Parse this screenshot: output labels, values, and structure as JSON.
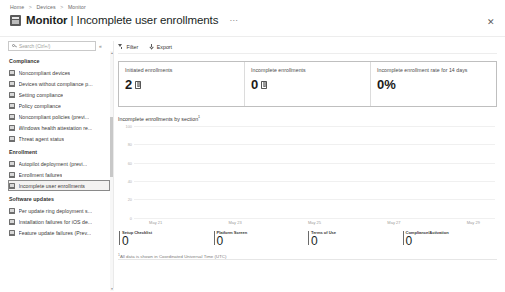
{
  "breadcrumb": {
    "items": [
      "Home",
      "Devices",
      "Monitor"
    ],
    "separator": ">"
  },
  "header": {
    "title_main": "Monitor",
    "title_separator": "|",
    "title_sub": "Incomplete user enrollments",
    "ellipsis": "…",
    "close_label": "✕",
    "icon": "monitor-icon"
  },
  "sidebar": {
    "search": {
      "placeholder": "Search (Ctrl+/)",
      "value": "",
      "icon": "search-icon"
    },
    "collapse_label": "«",
    "groups": [
      {
        "title": "Compliance",
        "items": [
          {
            "label": "Noncompliant devices",
            "selected": false
          },
          {
            "label": "Devices without compliance p...",
            "selected": false
          },
          {
            "label": "Setting compliance",
            "selected": false
          },
          {
            "label": "Policy compliance",
            "selected": false
          },
          {
            "label": "Noncompliant policies (previ...",
            "selected": false
          },
          {
            "label": "Windows health attestation re...",
            "selected": false
          },
          {
            "label": "Threat agent status",
            "selected": false
          }
        ]
      },
      {
        "title": "Enrollment",
        "items": [
          {
            "label": "Autopilot deployment (previ...",
            "selected": false
          },
          {
            "label": "Enrollment failures",
            "selected": false
          },
          {
            "label": "Incomplete user enrollments",
            "selected": true
          }
        ]
      },
      {
        "title": "Software updates",
        "items": [
          {
            "label": "Per update ring deployment s...",
            "selected": false
          },
          {
            "label": "Installation failures for iOS de...",
            "selected": false
          },
          {
            "label": "Feature update failures (Prev...",
            "selected": false
          }
        ]
      }
    ],
    "scrollbar": {
      "up_arrow": "▲",
      "down_arrow": "▼"
    }
  },
  "toolbar": {
    "filter_label": "Filter",
    "export_label": "Export"
  },
  "kpis": [
    {
      "title": "Initiated enrollments",
      "value": "2",
      "icon": "device-icon"
    },
    {
      "title": "Incomplete enrollments",
      "value": "0",
      "icon": "device-icon"
    },
    {
      "title": "Incomplete enrollment rate for 14 days",
      "value": "0%",
      "icon": "none"
    }
  ],
  "chart_data": {
    "type": "line",
    "title": "Incomplete enrollments by section",
    "title_footnote_marker": "1",
    "xlabel": "",
    "ylabel": "",
    "ylim": [
      0,
      100
    ],
    "yticks": [
      "100",
      "80",
      "60",
      "40",
      "20",
      "0"
    ],
    "x": [
      "May 21",
      "May 23",
      "May 25",
      "May 27",
      "May 29"
    ],
    "xticks": [
      "May 21",
      "May 23",
      "May 25",
      "May 27",
      "May 29"
    ],
    "grid": true,
    "legend_position": "bottom",
    "series": [
      {
        "name": "Setup Checklist",
        "values": [
          0,
          0,
          0,
          0,
          0
        ],
        "total": "0"
      },
      {
        "name": "Platform Screen",
        "values": [
          0,
          0,
          0,
          0,
          0
        ],
        "total": "0"
      },
      {
        "name": "Terms of Use",
        "values": [
          0,
          0,
          0,
          0,
          0
        ],
        "total": "0"
      },
      {
        "name": "Compliance/Activation",
        "values": [
          0,
          0,
          0,
          0,
          0
        ],
        "total": "0"
      }
    ]
  },
  "footnote": {
    "marker": "1",
    "text": "All data is shown in Coordinated Universal Time (UTC)"
  }
}
